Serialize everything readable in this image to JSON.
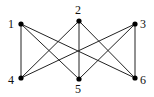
{
  "graph": {
    "type": "complete-bipartite K3,3",
    "nodes": [
      {
        "id": "1",
        "label": "1",
        "x": 21,
        "y": 24,
        "lx": 8,
        "ly": 28
      },
      {
        "id": "2",
        "label": "2",
        "x": 79,
        "y": 21,
        "lx": 75,
        "ly": 14
      },
      {
        "id": "3",
        "label": "3",
        "x": 135,
        "y": 24,
        "lx": 140,
        "ly": 28
      },
      {
        "id": "4",
        "label": "4",
        "x": 21,
        "y": 78,
        "lx": 8,
        "ly": 84
      },
      {
        "id": "5",
        "label": "5",
        "x": 79,
        "y": 79,
        "lx": 75,
        "ly": 93
      },
      {
        "id": "6",
        "label": "6",
        "x": 135,
        "y": 78,
        "lx": 140,
        "ly": 84
      }
    ],
    "edges": [
      [
        "1",
        "4"
      ],
      [
        "1",
        "5"
      ],
      [
        "1",
        "6"
      ],
      [
        "2",
        "4"
      ],
      [
        "2",
        "5"
      ],
      [
        "2",
        "6"
      ],
      [
        "3",
        "4"
      ],
      [
        "3",
        "5"
      ],
      [
        "3",
        "6"
      ]
    ]
  }
}
